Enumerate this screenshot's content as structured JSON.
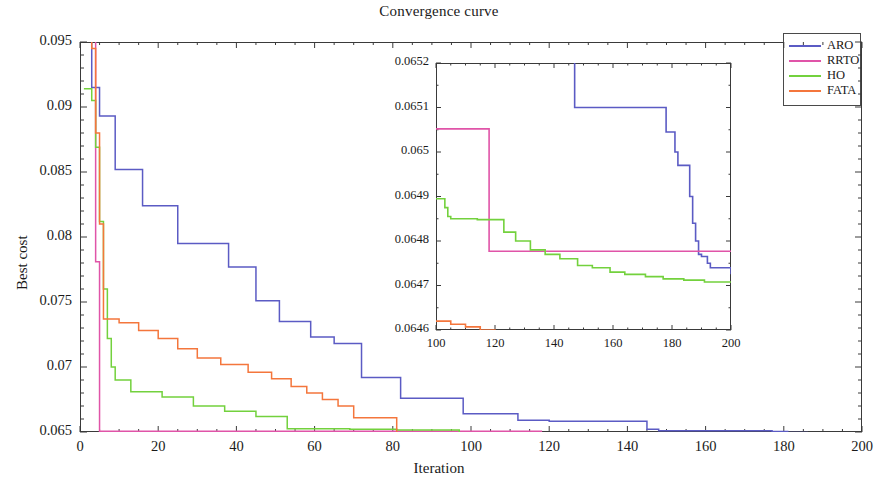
{
  "chart_data": {
    "type": "line",
    "title": "Convergence curve",
    "xlabel": "Iteration",
    "ylabel": "Best cost",
    "xlim": [
      0,
      200
    ],
    "ylim": [
      0.065,
      0.095
    ],
    "xticks": [
      0,
      20,
      40,
      60,
      80,
      100,
      120,
      140,
      160,
      180,
      200
    ],
    "xticklabels": [
      "0",
      "20",
      "40",
      "60",
      "80",
      "100",
      "120",
      "140",
      "160",
      "180",
      "200"
    ],
    "yticks": [
      0.065,
      0.07,
      0.075,
      0.08,
      0.085,
      0.09,
      0.095
    ],
    "yticklabels": [
      "0.065",
      "0.07",
      "0.075",
      "0.08",
      "0.085",
      "0.09",
      "0.095"
    ],
    "grid": false,
    "legend_position": "top-right",
    "legend": [
      "ARO",
      "RRTO",
      "HO",
      "FATA"
    ],
    "colors": {
      "ARO": "#5b5bc4",
      "RRTO": "#e054a8",
      "HO": "#73d13d",
      "FATA": "#f4763c"
    },
    "series": [
      {
        "name": "ARO",
        "color": "#5b5bc4",
        "x": [
          1,
          2,
          3,
          4,
          5,
          6,
          9,
          10,
          16,
          17,
          24,
          25,
          29,
          30,
          37,
          38,
          44,
          45,
          50,
          51,
          58,
          59,
          64,
          65,
          71,
          72,
          81,
          82,
          97,
          98,
          111,
          112,
          119,
          120,
          144,
          145,
          147,
          148,
          158,
          159,
          176,
          177,
          180,
          181,
          185,
          186,
          188,
          189,
          190,
          191,
          193,
          200
        ],
        "y": [
          0.0952,
          0.0952,
          0.0915,
          0.0915,
          0.0893,
          0.0893,
          0.0852,
          0.0852,
          0.0824,
          0.0824,
          0.0824,
          0.0795,
          0.0795,
          0.0795,
          0.0795,
          0.0777,
          0.0777,
          0.0751,
          0.0751,
          0.0735,
          0.0735,
          0.0723,
          0.0723,
          0.0718,
          0.0718,
          0.0692,
          0.0692,
          0.0676,
          0.0676,
          0.0664,
          0.0664,
          0.0659,
          0.0659,
          0.06582,
          0.06582,
          0.06521,
          0.06521,
          0.0651,
          0.0651,
          0.0651,
          0.0651,
          0.06504,
          0.06504,
          0.06497,
          0.06497,
          0.06487,
          0.06487,
          0.06477,
          0.06477,
          0.06474,
          0.06474,
          0.06472
        ]
      },
      {
        "name": "RRTO",
        "color": "#e054a8",
        "x": [
          1,
          2,
          3,
          4,
          5,
          6,
          117,
          118,
          200
        ],
        "y": [
          0.0985,
          0.0985,
          0.096,
          0.0781,
          0.06505,
          0.06505,
          0.06505,
          0.064775,
          0.064775
        ]
      },
      {
        "name": "HO",
        "color": "#73d13d",
        "x": [
          1,
          2,
          3,
          4,
          5,
          6,
          7,
          8,
          9,
          12,
          13,
          20,
          21,
          28,
          29,
          36,
          37,
          44,
          45,
          52,
          53,
          68,
          69,
          80,
          81,
          96,
          97,
          104,
          105,
          113,
          114,
          122,
          123,
          131,
          132,
          141,
          142,
          152,
          153,
          163,
          164,
          176,
          177,
          190,
          191,
          200
        ],
        "y": [
          0.0914,
          0.0914,
          0.0905,
          0.0869,
          0.0812,
          0.076,
          0.0722,
          0.07,
          0.069,
          0.069,
          0.0681,
          0.0681,
          0.0677,
          0.0677,
          0.067,
          0.067,
          0.0666,
          0.0666,
          0.0662,
          0.0662,
          0.06525,
          0.06525,
          0.06521,
          0.06521,
          0.06515,
          0.06515,
          0.064885,
          0.064885,
          0.064845,
          0.064845,
          0.064845,
          0.064845,
          0.064805,
          0.064805,
          0.064765,
          0.064765,
          0.064745,
          0.064745,
          0.064725,
          0.064725,
          0.064715,
          0.064715,
          0.06471,
          0.06471,
          0.064705,
          0.064705
        ]
      },
      {
        "name": "FATA",
        "color": "#f4763c",
        "x": [
          1,
          2,
          3,
          4,
          5,
          6,
          9,
          10,
          14,
          15,
          19,
          20,
          24,
          25,
          29,
          30,
          35,
          36,
          42,
          43,
          48,
          49,
          53,
          54,
          57,
          58,
          61,
          62,
          65,
          66,
          69,
          70,
          80,
          81,
          99,
          100,
          107,
          108,
          118,
          119,
          132,
          133,
          150,
          151,
          190,
          200
        ],
        "y": [
          0.096,
          0.096,
          0.0945,
          0.088,
          0.081,
          0.0737,
          0.0737,
          0.0734,
          0.0734,
          0.0728,
          0.0728,
          0.0722,
          0.0722,
          0.0714,
          0.0714,
          0.0707,
          0.0707,
          0.0702,
          0.0702,
          0.0696,
          0.0696,
          0.0691,
          0.0691,
          0.0685,
          0.0685,
          0.068,
          0.068,
          0.0675,
          0.0675,
          0.067,
          0.067,
          0.0661,
          0.0661,
          0.064625,
          0.064625,
          0.06461,
          0.06461,
          0.064595,
          0.064595,
          0.064582,
          0.064582,
          0.064565,
          0.064565,
          0.064565,
          0.064565,
          0.06457
        ]
      }
    ]
  },
  "inset": {
    "type": "line",
    "xlim": [
      100,
      200
    ],
    "ylim": [
      0.0646,
      0.0652
    ],
    "xticks": [
      100,
      120,
      140,
      160,
      180,
      200
    ],
    "xticklabels": [
      "100",
      "120",
      "140",
      "160",
      "180",
      "200"
    ],
    "yticks": [
      0.0646,
      0.0647,
      0.0648,
      0.0649,
      0.065,
      0.0651,
      0.0652
    ],
    "yticklabels": [
      "0.0646",
      "0.0647",
      "0.0648",
      "0.0649",
      "0.065",
      "0.0651",
      "0.0652"
    ],
    "series": [
      {
        "name": "ARO",
        "color": "#5b5bc4",
        "x": [
          143,
          144,
          145,
          146,
          147,
          148,
          177,
          178,
          180,
          181,
          182,
          185,
          186,
          187,
          188,
          189,
          190,
          191,
          192,
          193,
          200
        ],
        "y": [
          0.06535,
          0.06535,
          0.06521,
          0.06521,
          0.0651,
          0.0651,
          0.0651,
          0.065045,
          0.065045,
          0.065,
          0.06497,
          0.06497,
          0.0649,
          0.06484,
          0.0648,
          0.06477,
          0.064765,
          0.064765,
          0.06475,
          0.06474,
          0.064725
        ]
      },
      {
        "name": "RRTO",
        "color": "#e054a8",
        "x": [
          100,
          117,
          118,
          200
        ],
        "y": [
          0.065052,
          0.065052,
          0.064777,
          0.064777
        ]
      },
      {
        "name": "HO",
        "color": "#73d13d",
        "x": [
          100,
          102,
          103,
          104,
          105,
          113,
          114,
          122,
          123,
          126,
          127,
          131,
          132,
          136,
          137,
          141,
          142,
          147,
          148,
          152,
          153,
          158,
          159,
          163,
          164,
          170,
          171,
          176,
          177,
          183,
          184,
          190,
          191,
          200
        ],
        "y": [
          0.064895,
          0.064895,
          0.064875,
          0.064855,
          0.06485,
          0.06485,
          0.064848,
          0.064848,
          0.06482,
          0.06482,
          0.0648,
          0.0648,
          0.06478,
          0.06478,
          0.06477,
          0.06477,
          0.06476,
          0.06476,
          0.064745,
          0.064745,
          0.06474,
          0.06474,
          0.06473,
          0.06473,
          0.064725,
          0.064725,
          0.06472,
          0.06472,
          0.064715,
          0.064715,
          0.064712,
          0.064712,
          0.064708,
          0.064708
        ]
      },
      {
        "name": "FATA",
        "color": "#f4763c",
        "x": [
          100,
          104,
          105,
          109,
          110,
          114,
          115,
          119,
          120,
          124,
          125,
          129,
          130,
          132,
          133,
          150,
          151,
          188,
          189,
          200
        ],
        "y": [
          0.06462,
          0.06462,
          0.064613,
          0.064613,
          0.064607,
          0.064607,
          0.0646,
          0.0646,
          0.064593,
          0.064593,
          0.064588,
          0.064588,
          0.064583,
          0.064583,
          0.064566,
          0.064566,
          0.064566,
          0.064566,
          0.06457,
          0.06457
        ]
      }
    ]
  }
}
